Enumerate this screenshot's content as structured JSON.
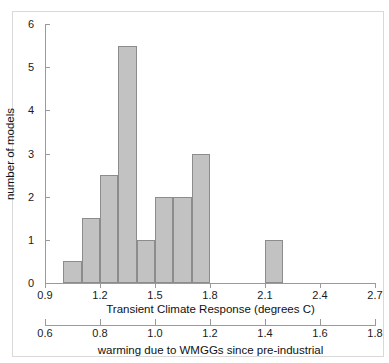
{
  "chart_data": {
    "type": "bar",
    "title": "",
    "subtitle": "",
    "xlabel": "Transient Climate Response (degrees C)",
    "ylabel": "number of models",
    "secondary_xlabel": "warming due to WMGGs since pre-industrial",
    "xlim": [
      0.9,
      2.7
    ],
    "ylim": [
      0,
      6
    ],
    "secondary_xlim": [
      0.6,
      1.8
    ],
    "xticks": [
      0.9,
      1.2,
      1.5,
      1.8,
      2.1,
      2.4,
      2.7
    ],
    "xtick_labels": [
      "0.9",
      "1.2",
      "1.5",
      "1.8",
      "2.1",
      "2.4",
      "2.7"
    ],
    "yticks": [
      0,
      1,
      2,
      3,
      4,
      5,
      6
    ],
    "ytick_labels": [
      "0",
      "1",
      "2",
      "3",
      "4",
      "5",
      "6"
    ],
    "secondary_xticks": [
      0.6,
      0.8,
      1.0,
      1.2,
      1.4,
      1.6,
      1.8
    ],
    "secondary_xtick_labels": [
      "0.6",
      "0.8",
      "1.0",
      "1.2",
      "1.4",
      "1.6",
      "1.8"
    ],
    "grid": false,
    "legend": null,
    "bar_color": "#c2c2c2",
    "bar_edge_color": "#8c8c8c",
    "bin_width": 0.1,
    "bins": [
      {
        "left": 1.0,
        "right": 1.1,
        "height": 0.5
      },
      {
        "left": 1.1,
        "right": 1.2,
        "height": 1.5
      },
      {
        "left": 1.2,
        "right": 1.3,
        "height": 2.5
      },
      {
        "left": 1.3,
        "right": 1.4,
        "height": 5.5
      },
      {
        "left": 1.4,
        "right": 1.5,
        "height": 1.0
      },
      {
        "left": 1.5,
        "right": 1.6,
        "height": 2.0
      },
      {
        "left": 1.6,
        "right": 1.7,
        "height": 2.0
      },
      {
        "left": 1.7,
        "right": 1.8,
        "height": 3.0
      },
      {
        "left": 2.1,
        "right": 2.2,
        "height": 1.0
      }
    ],
    "bars_px": [
      {
        "label": "bin-1.0-1.1",
        "x": 0.0,
        "w": 0.1,
        "h": 0.5
      },
      {
        "label": "bin-1.1-1.2",
        "x": 0.1,
        "w": 0.1,
        "h": 1.5
      },
      {
        "label": "bin-1.2-1.3",
        "x": 0.2,
        "w": 0.1,
        "h": 2.5
      },
      {
        "label": "bin-1.3-1.4",
        "x": 0.3,
        "w": 0.1,
        "h": 5.5
      },
      {
        "label": "bin-1.4-1.5",
        "x": 0.4,
        "w": 0.1,
        "h": 1.0
      },
      {
        "label": "bin-1.5-1.6",
        "x": 0.5,
        "w": 0.1,
        "h": 2.0
      },
      {
        "label": "bin-1.6-1.7",
        "x": 0.6,
        "w": 0.1,
        "h": 2.0
      },
      {
        "label": "bin-1.7-1.8",
        "x": 0.7,
        "w": 0.1,
        "h": 3.0
      },
      {
        "label": "bin-2.1-2.2",
        "x": 1.1,
        "w": 0.1,
        "h": 1.0
      }
    ]
  }
}
